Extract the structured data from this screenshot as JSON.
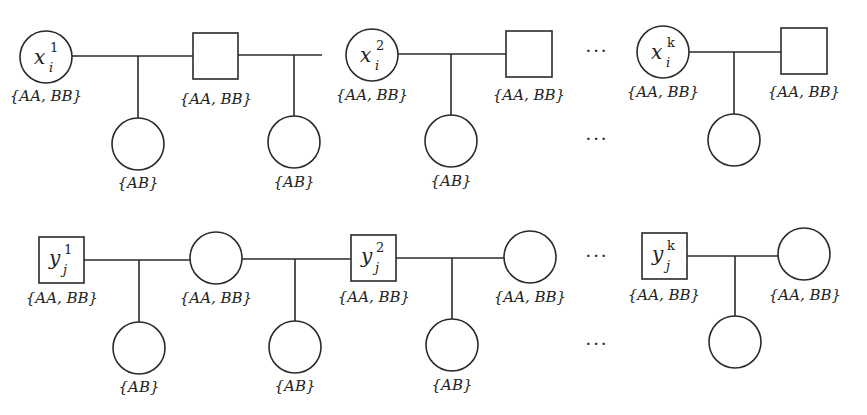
{
  "diagram": {
    "type": "pedigree",
    "colors": {
      "stroke": "#2a2a2a",
      "text": "#222222",
      "background": "#ffffff"
    },
    "rows": [
      {
        "id": "x-row",
        "founders": [
          {
            "shape": "circle",
            "symbol": "x",
            "superscript": "1",
            "subscript": "i",
            "genotypes": "{AA, BB}"
          },
          {
            "shape": "square",
            "symbol": "",
            "genotypes": "{AA, BB}"
          },
          {
            "shape": "circle",
            "symbol": "x",
            "superscript": "2",
            "subscript": "i",
            "genotypes": "{AA, BB}"
          },
          {
            "shape": "square",
            "symbol": "",
            "genotypes": "{AA, BB}"
          },
          {
            "shape": "circle",
            "symbol": "x",
            "superscript": "k",
            "subscript": "i",
            "genotypes": "{AA, BB}"
          },
          {
            "shape": "square",
            "symbol": "",
            "genotypes": "{AA, BB}"
          }
        ],
        "children": [
          {
            "shape": "circle",
            "genotypes": "{AB}"
          },
          {
            "shape": "circle",
            "genotypes": "{AB}"
          },
          {
            "shape": "circle",
            "genotypes": "{AB}"
          },
          {
            "shape": "circle",
            "genotypes": ""
          }
        ],
        "ellipsis": "···"
      },
      {
        "id": "y-row",
        "founders": [
          {
            "shape": "square",
            "symbol": "y",
            "superscript": "1",
            "subscript": "j",
            "genotypes": "{AA, BB}"
          },
          {
            "shape": "circle",
            "symbol": "",
            "genotypes": "{AA, BB}"
          },
          {
            "shape": "square",
            "symbol": "y",
            "superscript": "2",
            "subscript": "j",
            "genotypes": "{AA, BB}"
          },
          {
            "shape": "circle",
            "symbol": "",
            "genotypes": "{AA, BB}"
          },
          {
            "shape": "square",
            "symbol": "y",
            "superscript": "k",
            "subscript": "j",
            "genotypes": "{AA, BB}"
          },
          {
            "shape": "circle",
            "symbol": "",
            "genotypes": "{AA, BB}"
          }
        ],
        "children": [
          {
            "shape": "circle",
            "genotypes": "{AB}"
          },
          {
            "shape": "circle",
            "genotypes": "{AB}"
          },
          {
            "shape": "circle",
            "genotypes": "{AB}"
          },
          {
            "shape": "circle",
            "genotypes": ""
          }
        ],
        "ellipsis": "···"
      }
    ]
  }
}
